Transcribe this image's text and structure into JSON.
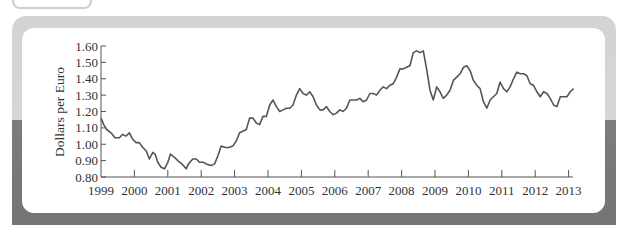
{
  "chart_data": {
    "type": "line",
    "title": "",
    "xlabel": "",
    "ylabel": "Dollars per Euro",
    "ylim": [
      0.8,
      1.6
    ],
    "xlim": [
      1999,
      2013.25
    ],
    "grid": false,
    "legend": null,
    "y_ticks": [
      "0.80",
      "0.90",
      "1.00",
      "1.10",
      "1.20",
      "1.30",
      "1.40",
      "1.50",
      "1.60"
    ],
    "x_ticks": [
      "1999",
      "2000",
      "2001",
      "2002",
      "2003",
      "2004",
      "2005",
      "2006",
      "2007",
      "2008",
      "2009",
      "2010",
      "2011",
      "2012",
      "2013"
    ],
    "series": [
      {
        "name": "Dollars per Euro",
        "x": [
          1999.0,
          1999.08,
          1999.17,
          1999.3,
          1999.42,
          1999.55,
          1999.65,
          1999.75,
          1999.85,
          1999.95,
          2000.05,
          2000.15,
          2000.25,
          2000.35,
          2000.45,
          2000.55,
          2000.62,
          2000.7,
          2000.8,
          2000.9,
          2001.0,
          2001.08,
          2001.2,
          2001.3,
          2001.42,
          2001.55,
          2001.62,
          2001.75,
          2001.85,
          2001.95,
          2002.05,
          2002.15,
          2002.3,
          2002.4,
          2002.5,
          2002.6,
          2002.72,
          2002.82,
          2002.95,
          2003.05,
          2003.15,
          2003.25,
          2003.35,
          2003.45,
          2003.55,
          2003.65,
          2003.75,
          2003.85,
          2003.95,
          2004.05,
          2004.15,
          2004.25,
          2004.35,
          2004.45,
          2004.55,
          2004.65,
          2004.75,
          2004.85,
          2004.95,
          2005.05,
          2005.15,
          2005.25,
          2005.35,
          2005.45,
          2005.55,
          2005.65,
          2005.75,
          2005.85,
          2005.95,
          2006.05,
          2006.15,
          2006.25,
          2006.35,
          2006.45,
          2006.55,
          2006.65,
          2006.75,
          2006.85,
          2006.95,
          2007.05,
          2007.15,
          2007.25,
          2007.35,
          2007.45,
          2007.55,
          2007.65,
          2007.75,
          2007.85,
          2007.95,
          2008.05,
          2008.15,
          2008.25,
          2008.35,
          2008.45,
          2008.55,
          2008.65,
          2008.75,
          2008.85,
          2008.95,
          2009.05,
          2009.15,
          2009.25,
          2009.35,
          2009.45,
          2009.55,
          2009.65,
          2009.75,
          2009.85,
          2009.95,
          2010.05,
          2010.15,
          2010.25,
          2010.35,
          2010.45,
          2010.55,
          2010.65,
          2010.75,
          2010.85,
          2010.95,
          2011.05,
          2011.15,
          2011.25,
          2011.35,
          2011.45,
          2011.55,
          2011.65,
          2011.75,
          2011.85,
          2011.95,
          2012.05,
          2012.15,
          2012.25,
          2012.35,
          2012.45,
          2012.55,
          2012.65,
          2012.75,
          2012.85,
          2012.95,
          2013.05,
          2013.15
        ],
        "values": [
          1.16,
          1.12,
          1.09,
          1.07,
          1.04,
          1.04,
          1.06,
          1.05,
          1.07,
          1.03,
          1.01,
          1.01,
          0.98,
          0.96,
          0.91,
          0.95,
          0.94,
          0.89,
          0.86,
          0.85,
          0.89,
          0.94,
          0.92,
          0.9,
          0.88,
          0.85,
          0.88,
          0.91,
          0.91,
          0.89,
          0.89,
          0.88,
          0.87,
          0.88,
          0.93,
          0.99,
          0.98,
          0.98,
          0.99,
          1.02,
          1.07,
          1.08,
          1.09,
          1.16,
          1.16,
          1.13,
          1.12,
          1.17,
          1.17,
          1.24,
          1.27,
          1.23,
          1.2,
          1.21,
          1.22,
          1.22,
          1.24,
          1.3,
          1.34,
          1.31,
          1.3,
          1.32,
          1.29,
          1.24,
          1.21,
          1.21,
          1.23,
          1.2,
          1.18,
          1.19,
          1.21,
          1.2,
          1.22,
          1.27,
          1.27,
          1.27,
          1.28,
          1.26,
          1.27,
          1.31,
          1.31,
          1.3,
          1.33,
          1.35,
          1.34,
          1.36,
          1.37,
          1.41,
          1.46,
          1.46,
          1.47,
          1.48,
          1.56,
          1.57,
          1.56,
          1.57,
          1.46,
          1.33,
          1.27,
          1.35,
          1.32,
          1.28,
          1.3,
          1.33,
          1.39,
          1.41,
          1.43,
          1.47,
          1.48,
          1.45,
          1.39,
          1.36,
          1.34,
          1.26,
          1.22,
          1.27,
          1.29,
          1.31,
          1.38,
          1.34,
          1.32,
          1.35,
          1.4,
          1.44,
          1.43,
          1.43,
          1.42,
          1.37,
          1.36,
          1.32,
          1.29,
          1.32,
          1.31,
          1.28,
          1.24,
          1.23,
          1.29,
          1.29,
          1.29,
          1.32,
          1.34
        ]
      }
    ]
  },
  "style": {
    "line_color": "#555555",
    "axis_color": "#555555",
    "frame_top_color": "#d4d4d4",
    "frame_bottom_color": "#787878",
    "card_color": "#ffffff"
  }
}
